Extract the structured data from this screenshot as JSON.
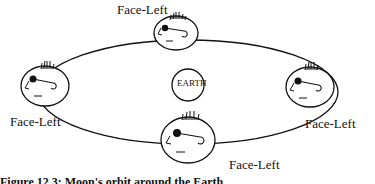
{
  "diagram": {
    "center_label": "EARTH",
    "positions": [
      {
        "id": "top",
        "label": "Face-Left"
      },
      {
        "id": "left",
        "label": "Face-Left"
      },
      {
        "id": "right",
        "label": "Face-Left"
      },
      {
        "id": "bottom",
        "label": "Face-Left"
      }
    ],
    "caption": "Figure 12.3: Moon's orbit around the Earth"
  }
}
